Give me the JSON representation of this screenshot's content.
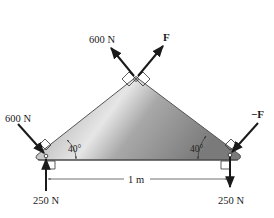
{
  "figure": {
    "shape": "triangular plate",
    "colors": {
      "plate_light": "#e4e4e4",
      "plate_mid": "#b4b4b4",
      "plate_dark": "#7a7a7a",
      "outline": "#555555",
      "arrow": "#1a1a1a"
    },
    "forces": {
      "apex_left": {
        "label": "600 N"
      },
      "apex_right": {
        "label": "F"
      },
      "left_inclined": {
        "label": "600 N"
      },
      "right_inclined": {
        "label": "−F"
      },
      "left_vertical": {
        "label": "250 N"
      },
      "right_vertical": {
        "label": "250 N"
      }
    },
    "angles": {
      "left": "40°",
      "right": "40°"
    },
    "dimension": {
      "label": "1 m"
    }
  }
}
